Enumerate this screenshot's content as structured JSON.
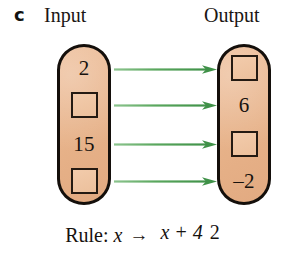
{
  "part_label": "c",
  "columns": {
    "input_heading": "Input",
    "output_heading": "Output"
  },
  "colors": {
    "pill_fill": "#e9b58c",
    "pill_outline": "#140f0b",
    "box_fill": "#efc6a3",
    "box_outline": "#241a12",
    "arrow": "#4c9e52",
    "text": "#17120e",
    "background": "#ffffff"
  },
  "input_cells": [
    {
      "type": "value",
      "text": "2"
    },
    {
      "type": "blank",
      "text": ""
    },
    {
      "type": "value",
      "text": "15"
    },
    {
      "type": "blank",
      "text": ""
    }
  ],
  "output_cells": [
    {
      "type": "blank",
      "text": ""
    },
    {
      "type": "value",
      "text": "6"
    },
    {
      "type": "blank",
      "text": ""
    },
    {
      "type": "value",
      "text": "–2"
    }
  ],
  "arrows": [
    {
      "name": "mapping-arrow-1"
    },
    {
      "name": "mapping-arrow-2"
    },
    {
      "name": "mapping-arrow-3"
    },
    {
      "name": "mapping-arrow-4"
    }
  ],
  "rule": {
    "label": "Rule:",
    "variable": "x",
    "arrow": "→",
    "numerator": "x + 4",
    "denominator": "2"
  }
}
